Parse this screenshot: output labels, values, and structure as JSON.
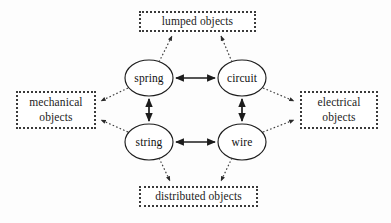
{
  "diagram": {
    "background_color": "#fdfdfd",
    "stroke_color": "#1c1c1c",
    "nodes": [
      {
        "id": "spring",
        "label": "spring",
        "cx": 149,
        "cy": 78,
        "rx": 24,
        "ry": 18
      },
      {
        "id": "circuit",
        "label": "circuit",
        "cx": 242,
        "cy": 78,
        "rx": 24,
        "ry": 18
      },
      {
        "id": "string",
        "label": "string",
        "cx": 149,
        "cy": 142,
        "rx": 24,
        "ry": 18
      },
      {
        "id": "wire",
        "label": "wire",
        "cx": 242,
        "cy": 142,
        "rx": 24,
        "ry": 18
      }
    ],
    "categories": [
      {
        "id": "lumped",
        "label_line1": "lumped objects",
        "label_line2": "",
        "position": "top"
      },
      {
        "id": "mechanical",
        "label_line1": "mechanical",
        "label_line2": "objects",
        "position": "left"
      },
      {
        "id": "electrical",
        "label_line1": "electrical",
        "label_line2": "objects",
        "position": "right"
      },
      {
        "id": "distributed",
        "label_line1": "distributed objects",
        "label_line2": "",
        "position": "bottom"
      }
    ],
    "solid_edges": [
      {
        "from": "spring",
        "to": "circuit",
        "style": "solid",
        "arrows": "double",
        "orientation": "horizontal"
      },
      {
        "from": "string",
        "to": "wire",
        "style": "solid",
        "arrows": "double",
        "orientation": "horizontal"
      },
      {
        "from": "spring",
        "to": "string",
        "style": "solid",
        "arrows": "double",
        "orientation": "vertical"
      },
      {
        "from": "circuit",
        "to": "wire",
        "style": "solid",
        "arrows": "double",
        "orientation": "vertical"
      }
    ],
    "dotted_edges": [
      {
        "from": "spring",
        "to": "lumped",
        "style": "dotted",
        "arrows": "single"
      },
      {
        "from": "circuit",
        "to": "lumped",
        "style": "dotted",
        "arrows": "single"
      },
      {
        "from": "spring",
        "to": "mechanical",
        "style": "dotted",
        "arrows": "single"
      },
      {
        "from": "string",
        "to": "mechanical",
        "style": "dotted",
        "arrows": "single"
      },
      {
        "from": "circuit",
        "to": "electrical",
        "style": "dotted",
        "arrows": "single"
      },
      {
        "from": "wire",
        "to": "electrical",
        "style": "dotted",
        "arrows": "single"
      },
      {
        "from": "string",
        "to": "distributed",
        "style": "dotted",
        "arrows": "single"
      },
      {
        "from": "wire",
        "to": "distributed",
        "style": "dotted",
        "arrows": "single"
      }
    ]
  }
}
